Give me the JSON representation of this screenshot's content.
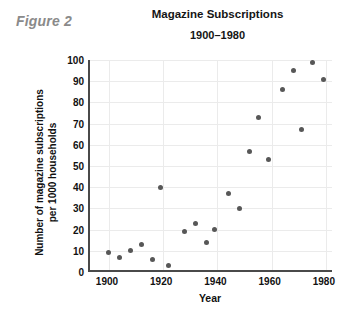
{
  "figure_label": "Figure 2",
  "chart_data": {
    "type": "scatter",
    "title": "Magazine Subscriptions",
    "subtitle": "1900–1980",
    "xlabel": "Year",
    "ylabel": "Number of magazine subscriptions per 1000 households",
    "ylabel_lines": [
      "Number of magazine subscriptions",
      "per 1000 households"
    ],
    "xlim": [
      1893,
      1983
    ],
    "ylim": [
      0,
      100
    ],
    "xticks": [
      1900,
      1920,
      1940,
      1960,
      1980
    ],
    "xtick_labels": [
      "1900",
      "1920",
      "1940",
      "1960",
      "1980"
    ],
    "yticks": [
      0,
      10,
      20,
      30,
      40,
      50,
      60,
      70,
      80,
      90,
      100
    ],
    "ytick_labels": [
      "0",
      "10",
      "20",
      "30",
      "40",
      "50",
      "60",
      "70",
      "80",
      "90",
      "100"
    ],
    "grid": "both",
    "legend": "none",
    "marker_color": "#575757",
    "points": [
      {
        "x": 1900,
        "y": 9
      },
      {
        "x": 1904,
        "y": 7
      },
      {
        "x": 1908,
        "y": 10
      },
      {
        "x": 1912,
        "y": 13
      },
      {
        "x": 1916,
        "y": 6
      },
      {
        "x": 1919,
        "y": 40
      },
      {
        "x": 1922,
        "y": 3
      },
      {
        "x": 1928,
        "y": 19
      },
      {
        "x": 1932,
        "y": 23
      },
      {
        "x": 1936,
        "y": 14
      },
      {
        "x": 1939,
        "y": 20
      },
      {
        "x": 1944,
        "y": 37
      },
      {
        "x": 1948,
        "y": 30
      },
      {
        "x": 1952,
        "y": 57
      },
      {
        "x": 1955,
        "y": 73
      },
      {
        "x": 1959,
        "y": 53
      },
      {
        "x": 1964,
        "y": 86
      },
      {
        "x": 1968,
        "y": 95
      },
      {
        "x": 1971,
        "y": 67
      },
      {
        "x": 1975,
        "y": 99
      },
      {
        "x": 1979,
        "y": 91
      }
    ]
  }
}
